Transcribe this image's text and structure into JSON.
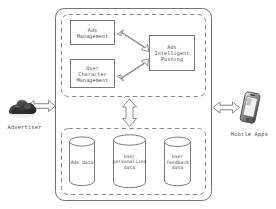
{
  "diagram": {
    "colors": {
      "stroke": "#6f6f6f",
      "dashed_stroke": "#7a7a7a",
      "box_stroke": "#6a6a6a",
      "arrow_fill": "#fdfdfd",
      "arrow_stroke": "#7d7d7d",
      "text": "#4a4a4a",
      "background": "#ffffff",
      "icon_dark": "#4a4a4a"
    },
    "outer_container": {
      "name": "platform-container",
      "style": "solid rounded rectangle"
    },
    "groups": [
      {
        "id": "service-layer",
        "style": "dashed rounded rectangle",
        "nodes": [
          {
            "id": "ads-management",
            "label": "Ads\nManagement"
          },
          {
            "id": "user-character-management",
            "label": "User\nCharacter\nManagement"
          },
          {
            "id": "ads-intelligent-pushing",
            "label": "Ads\nIntelligent\nPushing"
          }
        ]
      },
      {
        "id": "data-layer",
        "style": "dashed rounded rectangle",
        "nodes": [
          {
            "id": "ads-data",
            "label": "Ads data"
          },
          {
            "id": "user-personalized-data",
            "label": "User\npersonalized\ndata"
          },
          {
            "id": "user-feedback-data",
            "label": "User\nfeedback\ndata"
          }
        ]
      }
    ],
    "external_actors": [
      {
        "id": "advertiser",
        "label": "Advertiser",
        "icon": "advertiser-icon",
        "side": "left"
      },
      {
        "id": "mobile-apps",
        "label": "Mobile Apps",
        "icon": "mobile-phone-icon",
        "side": "right"
      }
    ],
    "connections": [
      {
        "id": "advertiser-to-platform",
        "from": "advertiser",
        "to": "platform-container",
        "type": "double-arrow",
        "orientation": "horizontal",
        "label": ""
      },
      {
        "id": "platform-to-mobile-apps",
        "from": "platform-container",
        "to": "mobile-apps",
        "type": "double-arrow",
        "orientation": "horizontal",
        "label": ""
      },
      {
        "id": "ads-management-to-pushing",
        "from": "ads-management",
        "to": "ads-intelligent-pushing",
        "type": "double-arrow",
        "orientation": "diagonal",
        "label": ""
      },
      {
        "id": "user-character-to-pushing",
        "from": "user-character-management",
        "to": "ads-intelligent-pushing",
        "type": "double-arrow",
        "orientation": "diagonal",
        "label": ""
      },
      {
        "id": "service-layer-to-data-layer",
        "from": "service-layer",
        "to": "data-layer",
        "type": "double-arrow",
        "orientation": "vertical",
        "label": ""
      }
    ]
  }
}
